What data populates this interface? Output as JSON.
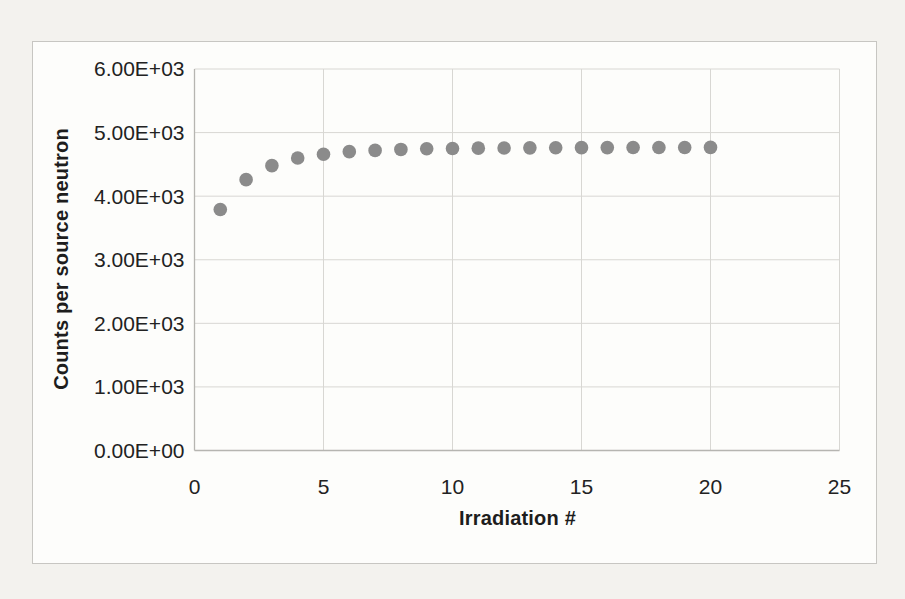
{
  "page": {
    "background_color": "#f3f2ee",
    "frame": {
      "background_color": "#fdfdfb",
      "border_color": "#c7c6c2"
    }
  },
  "chart_data": {
    "type": "scatter",
    "title": "",
    "xlabel": "Irradiation #",
    "ylabel": "Counts per source neutron",
    "x": [
      1,
      2,
      3,
      4,
      5,
      6,
      7,
      8,
      9,
      10,
      11,
      12,
      13,
      14,
      15,
      16,
      17,
      18,
      19,
      20
    ],
    "y": [
      3790,
      4260,
      4480,
      4600,
      4660,
      4700,
      4720,
      4735,
      4745,
      4750,
      4755,
      4758,
      4760,
      4762,
      4763,
      4764,
      4765,
      4766,
      4766,
      4767
    ],
    "xlim": [
      0,
      25
    ],
    "ylim": [
      0,
      6000
    ],
    "x_ticks": [
      {
        "value": 0,
        "label": "0"
      },
      {
        "value": 5,
        "label": "5"
      },
      {
        "value": 10,
        "label": "10"
      },
      {
        "value": 15,
        "label": "15"
      },
      {
        "value": 20,
        "label": "20"
      },
      {
        "value": 25,
        "label": "25"
      }
    ],
    "y_ticks": [
      {
        "value": 0,
        "label": "0.00E+00"
      },
      {
        "value": 1000,
        "label": "1.00E+03"
      },
      {
        "value": 2000,
        "label": "2.00E+03"
      },
      {
        "value": 3000,
        "label": "3.00E+03"
      },
      {
        "value": 4000,
        "label": "4.00E+03"
      },
      {
        "value": 5000,
        "label": "5.00E+03"
      },
      {
        "value": 6000,
        "label": "6.00E+03"
      }
    ],
    "grid": true,
    "legend": "none",
    "marker_radius_px": 6.8,
    "colors": {
      "marker": "#8b8b8b",
      "gridline": "#d8d7d3",
      "axis_line": "#b6b5b1",
      "text": "#222222"
    }
  }
}
